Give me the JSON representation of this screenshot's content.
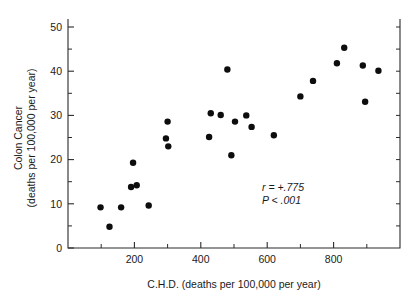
{
  "chart_data": {
    "type": "scatter",
    "title": "",
    "xlabel": "C.H.D. (deaths per 100,000 per year)",
    "ylabel_line1": "Colon Cancer",
    "ylabel_line2": "(deaths per 100,000 per year)",
    "xlim": [
      0,
      1000
    ],
    "ylim": [
      0,
      52
    ],
    "x_ticks_major": [
      200,
      400,
      600,
      800
    ],
    "x_ticks_minor": [
      0,
      100,
      300,
      500,
      700,
      900,
      1000
    ],
    "x_tick_labels": [
      "200",
      "400",
      "600",
      "800"
    ],
    "y_ticks_major": [
      0,
      10,
      20,
      30,
      40,
      50
    ],
    "y_ticks_minor": [
      5,
      15,
      25,
      35,
      45
    ],
    "y_tick_labels": [
      "0",
      "10",
      "20",
      "30",
      "40",
      "50"
    ],
    "grid": false,
    "legend": false,
    "marker": "filled-circle",
    "marker_color": "#0d0d0d",
    "points": [
      {
        "x": 98,
        "y": 9.2
      },
      {
        "x": 125,
        "y": 4.8
      },
      {
        "x": 160,
        "y": 9.2
      },
      {
        "x": 190,
        "y": 13.8
      },
      {
        "x": 196,
        "y": 19.3
      },
      {
        "x": 207,
        "y": 14.2
      },
      {
        "x": 243,
        "y": 9.6
      },
      {
        "x": 295,
        "y": 24.8
      },
      {
        "x": 300,
        "y": 28.6
      },
      {
        "x": 302,
        "y": 23.0
      },
      {
        "x": 425,
        "y": 25.1
      },
      {
        "x": 430,
        "y": 30.5
      },
      {
        "x": 460,
        "y": 30.1
      },
      {
        "x": 480,
        "y": 40.4
      },
      {
        "x": 492,
        "y": 21.0
      },
      {
        "x": 503,
        "y": 28.6
      },
      {
        "x": 537,
        "y": 30.0
      },
      {
        "x": 553,
        "y": 27.4
      },
      {
        "x": 620,
        "y": 25.5
      },
      {
        "x": 700,
        "y": 34.3
      },
      {
        "x": 738,
        "y": 37.8
      },
      {
        "x": 810,
        "y": 41.8
      },
      {
        "x": 832,
        "y": 45.3
      },
      {
        "x": 888,
        "y": 41.3
      },
      {
        "x": 895,
        "y": 33.1
      },
      {
        "x": 935,
        "y": 40.1
      }
    ],
    "annotations": [
      {
        "name": "correlation-coefficient",
        "text": "r = +.775"
      },
      {
        "name": "p-value",
        "text": "P < .001"
      }
    ]
  },
  "annotation_r": "r = +.775",
  "annotation_p": "P < .001"
}
